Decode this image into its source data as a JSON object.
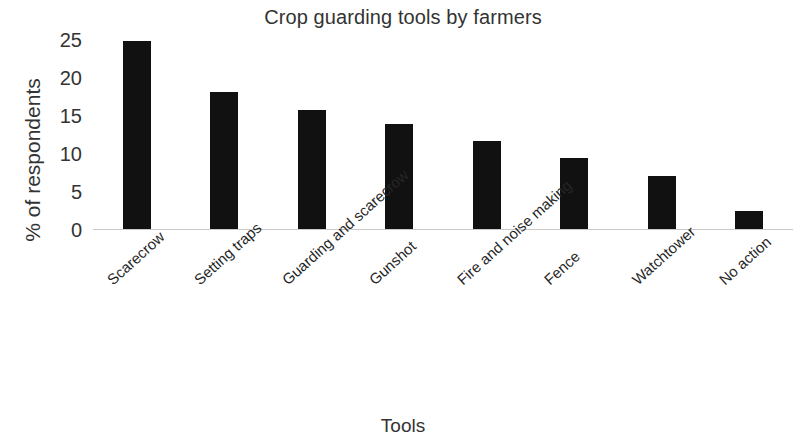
{
  "chart_data": {
    "type": "bar",
    "title": "Crop guarding tools by farmers",
    "xlabel": "Tools",
    "ylabel": "% of respondents",
    "categories": [
      "Scarecrow",
      "Setting traps",
      "Guarding and scarecrow",
      "Gunshot",
      "Fire and noise making",
      "Fence",
      "Watchtower",
      "No action"
    ],
    "values": [
      24.7,
      18.0,
      15.6,
      13.8,
      11.6,
      9.4,
      7.0,
      2.4
    ],
    "ylim": [
      0,
      25
    ],
    "yticks": [
      0,
      5,
      10,
      15,
      20,
      25
    ],
    "ytick_labels": [
      "0",
      "5",
      "10",
      "15",
      "20",
      "25"
    ],
    "grid": false,
    "legend": null,
    "bar_color": "#111111",
    "axis_color": "#c9c9c9",
    "background_color": "#ffffff"
  }
}
